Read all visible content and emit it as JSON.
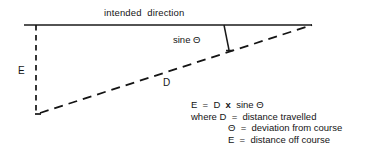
{
  "figure": {
    "title_label": "intended  direction",
    "hypotenuse_label": "D",
    "opposite_label": "E",
    "perpendicular_label": "sine Θ",
    "formula": {
      "equation": "E  =  D  ",
      "equation_operator": "x",
      "equation_tail": "  sine Θ",
      "line_where_d": "where D  =  distance travelled",
      "line_theta": "Θ  =  deviation from course",
      "line_e": "E  =  distance off course"
    },
    "colors": {
      "line": "#1a1a1a",
      "text": "#141414",
      "background": "#ffffff"
    },
    "geometry": {
      "baseline_start_x": 24,
      "baseline_start_y": 25,
      "baseline_end_x": 312,
      "baseline_end_y": 25,
      "vertical_x": 36,
      "vertical_top_y": 25,
      "vertical_bottom_y": 114,
      "diagonal_start_x": 36,
      "diagonal_start_y": 114,
      "diagonal_end_x": 312,
      "diagonal_end_y": 25,
      "perpendicular_top_x": 224,
      "perpendicular_top_y": 25,
      "perpendicular_bottom_x": 229,
      "perpendicular_bottom_y": 51
    }
  }
}
